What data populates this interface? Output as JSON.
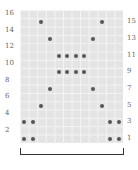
{
  "chart": {
    "columns": 12,
    "rows": 16,
    "left_labels": [
      "16",
      "14",
      "12",
      "10",
      "8",
      "6",
      "4",
      "2"
    ],
    "right_labels": [
      "15",
      "13",
      "11",
      "9",
      "7",
      "5",
      "3",
      "1"
    ],
    "dots": [
      {
        "row": 1,
        "cols": [
          1,
          2,
          11,
          12
        ]
      },
      {
        "row": 3,
        "cols": [
          1,
          2,
          11,
          12
        ]
      },
      {
        "row": 5,
        "cols": [
          3,
          10
        ]
      },
      {
        "row": 7,
        "cols": [
          4,
          9
        ]
      },
      {
        "row": 9,
        "cols": [
          5,
          6,
          7,
          8
        ]
      },
      {
        "row": 11,
        "cols": [
          5,
          6,
          7,
          8
        ]
      },
      {
        "row": 13,
        "cols": [
          4,
          9
        ]
      },
      {
        "row": 15,
        "cols": [
          3,
          10
        ]
      }
    ],
    "bracket": "pattern repeat"
  }
}
